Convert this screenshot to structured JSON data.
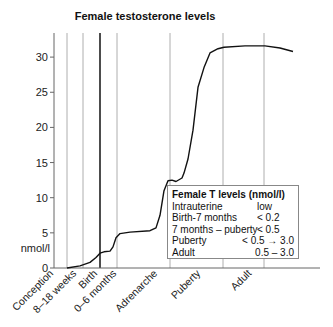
{
  "chart_data": {
    "type": "line",
    "title": "Female testosterone levels",
    "xlabel": "",
    "ylabel": "nmol/l",
    "ylim": [
      0,
      33
    ],
    "yticks": [
      0,
      5,
      10,
      15,
      20,
      25,
      30
    ],
    "grid": false,
    "stages": [
      {
        "label": "Conception",
        "x": 0
      },
      {
        "label": "8–18 weeks",
        "x": 13
      },
      {
        "label": "",
        "x": 29
      },
      {
        "label": "Birth",
        "x": 46,
        "emphasis": true
      },
      {
        "label": "0–6 months",
        "x": 63
      },
      {
        "label": "Adrenarche",
        "x": 116
      },
      {
        "label": "Puberty",
        "x": 169
      },
      {
        "label": "Adult",
        "x": 210
      }
    ],
    "x_axis_end": 266,
    "series": [
      {
        "name": "Female T level",
        "x": [
          13,
          26,
          36,
          42,
          46,
          50,
          56,
          59,
          62,
          66,
          76,
          96,
          102,
          106,
          110,
          114,
          118,
          122,
          128,
          130,
          134,
          139,
          144,
          150,
          156,
          164,
          170,
          191,
          211,
          226,
          239
        ],
        "y": [
          0,
          0.3,
          0.8,
          1.5,
          2.1,
          2.3,
          2.4,
          3.0,
          4.3,
          4.9,
          5.1,
          5.3,
          5.7,
          7.5,
          11.0,
          12.4,
          12.5,
          12.3,
          12.8,
          13.5,
          15.5,
          19.6,
          25.7,
          28.5,
          30.6,
          31.2,
          31.4,
          31.6,
          31.6,
          31.3,
          30.8
        ]
      }
    ],
    "legend": {
      "title": "Female T levels (nmol/l)",
      "rows": [
        {
          "stage": "Intrauterine",
          "value": "low"
        },
        {
          "stage": "Birth-7 months",
          "value": "< 0.2"
        },
        {
          "stage": "7 months – puberty",
          "value": "< 0.5"
        },
        {
          "stage": "Puberty",
          "value": "< 0.5 → 3.0"
        },
        {
          "stage": "Adult",
          "value": "0.5 – 3.0"
        }
      ]
    },
    "colors": {
      "line": "#111111",
      "stage_line": "#999999",
      "axis": "#666666"
    }
  }
}
